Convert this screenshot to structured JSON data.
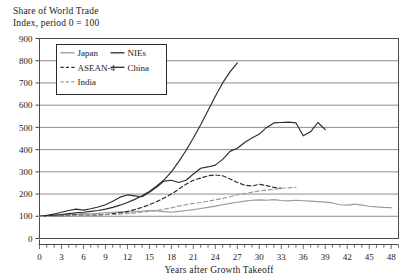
{
  "chart_data": {
    "type": "line",
    "title": "Share of World Trade",
    "subtitle": "Index, period 0 = 100",
    "xlabel": "Years after Growth Takeoff",
    "ylabel": "",
    "xlim": [
      0,
      49
    ],
    "ylim": [
      0,
      900
    ],
    "grid": true,
    "legend_position": "upper-left-inside",
    "ytick_labels": [
      "0",
      "100",
      "200",
      "300",
      "400",
      "500",
      "600",
      "700",
      "800",
      "900"
    ],
    "ytick_values": [
      0,
      100,
      200,
      300,
      400,
      500,
      600,
      700,
      800,
      900
    ],
    "xtick_labels": [
      "0",
      "3",
      "6",
      "9",
      "12",
      "15",
      "18",
      "21",
      "24",
      "27",
      "30",
      "33",
      "36",
      "39",
      "42",
      "45",
      "48"
    ],
    "xtick_values": [
      0,
      3,
      6,
      9,
      12,
      15,
      18,
      21,
      24,
      27,
      30,
      33,
      36,
      39,
      42,
      45,
      48
    ],
    "x_minor_step": 1,
    "series": [
      {
        "name": "Japan",
        "color": "#9a9a9a",
        "style": "solid",
        "x": [
          0,
          1,
          2,
          3,
          4,
          5,
          6,
          7,
          8,
          9,
          10,
          11,
          12,
          13,
          14,
          15,
          16,
          17,
          18,
          19,
          20,
          21,
          22,
          23,
          24,
          25,
          26,
          27,
          28,
          29,
          30,
          31,
          32,
          33,
          34,
          35,
          36,
          37,
          38,
          39,
          40,
          41,
          42,
          43,
          44,
          45,
          46,
          47,
          48
        ],
        "values": [
          100,
          101,
          103,
          106,
          108,
          110,
          112,
          111,
          113,
          116,
          118,
          120,
          119,
          121,
          123,
          126,
          124,
          121,
          118,
          122,
          126,
          130,
          135,
          140,
          146,
          152,
          158,
          163,
          168,
          172,
          174,
          172,
          175,
          171,
          169,
          172,
          170,
          168,
          166,
          164,
          160,
          152,
          150,
          155,
          150,
          145,
          142,
          140,
          139
        ]
      },
      {
        "name": "NIEs",
        "color": "#2b2b2b",
        "style": "solid",
        "x": [
          0,
          1,
          2,
          3,
          4,
          5,
          6,
          7,
          8,
          9,
          10,
          11,
          12,
          13,
          14,
          15,
          16,
          17,
          18,
          19,
          20,
          21,
          22,
          23,
          24,
          25,
          26,
          27,
          28,
          29,
          30,
          31,
          32,
          33,
          34,
          35,
          36,
          37,
          38,
          39
        ],
        "values": [
          100,
          104,
          110,
          118,
          126,
          132,
          128,
          134,
          142,
          152,
          168,
          186,
          196,
          192,
          188,
          208,
          232,
          258,
          262,
          252,
          262,
          290,
          316,
          322,
          330,
          356,
          392,
          406,
          432,
          452,
          470,
          500,
          520,
          522,
          524,
          520,
          462,
          480,
          522,
          490
        ]
      },
      {
        "name": "ASEAN-4",
        "color": "#2b2b2b",
        "style": "dashed",
        "x": [
          0,
          1,
          2,
          3,
          4,
          5,
          6,
          7,
          8,
          9,
          10,
          11,
          12,
          13,
          14,
          15,
          16,
          17,
          18,
          19,
          20,
          21,
          22,
          23,
          24,
          25,
          26,
          27,
          28,
          29,
          30,
          31,
          32,
          33
        ],
        "values": [
          100,
          100,
          101,
          102,
          104,
          106,
          105,
          104,
          106,
          108,
          112,
          116,
          122,
          130,
          140,
          152,
          166,
          182,
          200,
          222,
          244,
          262,
          272,
          282,
          286,
          282,
          268,
          252,
          240,
          236,
          244,
          238,
          230,
          226
        ]
      },
      {
        "name": "China",
        "color": "#2b2b2b",
        "style": "solid",
        "x": [
          0,
          1,
          2,
          3,
          4,
          5,
          6,
          7,
          8,
          9,
          10,
          11,
          12,
          13,
          14,
          15,
          16,
          17,
          18,
          19,
          20,
          21,
          22,
          23,
          24,
          25,
          26,
          27
        ],
        "values": [
          100,
          102,
          105,
          108,
          112,
          116,
          118,
          122,
          126,
          132,
          140,
          150,
          162,
          176,
          192,
          212,
          236,
          264,
          300,
          346,
          396,
          452,
          512,
          576,
          640,
          700,
          750,
          790
        ]
      },
      {
        "name": "India",
        "color": "#9a9a9a",
        "style": "dashed",
        "x": [
          0,
          1,
          2,
          3,
          4,
          5,
          6,
          7,
          8,
          9,
          10,
          11,
          12,
          13,
          14,
          15,
          16,
          17,
          18,
          19,
          20,
          21,
          22,
          23,
          24,
          25,
          26,
          27,
          28,
          29,
          30,
          31,
          32,
          33,
          34,
          35
        ],
        "values": [
          100,
          99,
          100,
          101,
          102,
          103,
          104,
          105,
          106,
          107,
          108,
          110,
          112,
          114,
          118,
          122,
          126,
          132,
          138,
          146,
          152,
          158,
          162,
          168,
          174,
          180,
          188,
          196,
          202,
          208,
          214,
          218,
          222,
          226,
          228,
          230
        ]
      }
    ]
  },
  "legend": {
    "entries": [
      {
        "label": "Japan"
      },
      {
        "label": "NIEs"
      },
      {
        "label": "ASEAN-4"
      },
      {
        "label": "China"
      },
      {
        "label": "India"
      }
    ]
  },
  "colors": {
    "axis": "#4a4a4a",
    "grid": "#6e6e6e",
    "dark_series": "#2b2b2b",
    "light_series": "#9a9a9a",
    "background": "#ffffff"
  }
}
